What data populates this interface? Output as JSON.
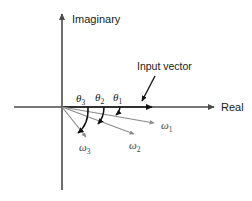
{
  "figure": {
    "background_color": "#ffffff",
    "axes": {
      "real_label": "Real",
      "imaginary_label": "Imaginary",
      "axis_color": "#4a4a4a",
      "origin": {
        "x": 62,
        "y": 107
      }
    },
    "annotations": {
      "input_vector_label": "Input vector",
      "leader_color": "#1a1a1a"
    },
    "angles": [
      {
        "symbol": "θ",
        "subscript": "1",
        "label": "θ1",
        "label_x": 116,
        "label_y": 98
      },
      {
        "symbol": "θ",
        "subscript": "2",
        "label": "θ2",
        "label_x": 98,
        "label_y": 98
      },
      {
        "symbol": "θ",
        "subscript": "3",
        "label": "θ3",
        "label_x": 79,
        "label_y": 99
      }
    ],
    "vectors": [
      {
        "symbol": "ω",
        "subscript": "1",
        "label": "ω1",
        "label_x": 160,
        "label_y": 128,
        "color": "#8c8c8c",
        "tip_x": 152,
        "tip_y": 122
      },
      {
        "symbol": "ω",
        "subscript": "2",
        "label": "ω2",
        "label_x": 131,
        "label_y": 148,
        "color": "#8c8c8c",
        "tip_x": 133,
        "tip_y": 133
      },
      {
        "symbol": "ω",
        "subscript": "3",
        "label": "ω3",
        "label_x": 82,
        "label_y": 150,
        "color": "#8c8c8c",
        "tip_x": 85,
        "tip_y": 136
      }
    ],
    "colors": {
      "axis": "#4a4a4a",
      "arc": "#111111",
      "vector_gray": "#8c8c8c",
      "text": "#1a1a1a"
    }
  }
}
